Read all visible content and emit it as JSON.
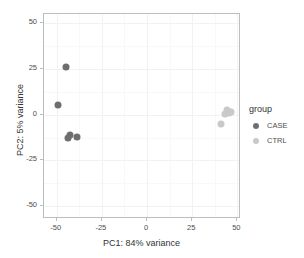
{
  "chart_data": {
    "type": "scatter",
    "title": "",
    "xlabel": "PC1: 84% variance",
    "ylabel": "PC2: 5% variance",
    "xlim": [
      -57,
      52
    ],
    "ylim": [
      -57,
      55
    ],
    "xticks": [
      -50,
      -25,
      0,
      25,
      50
    ],
    "yticks": [
      -50,
      -25,
      0,
      25,
      50
    ],
    "xtick_labels": [
      "-50",
      "-25",
      "0",
      "25",
      "50"
    ],
    "ytick_labels": [
      "-50",
      "-25",
      "0",
      "25",
      "50"
    ],
    "grid": true,
    "legend_position": "right",
    "legend_title": "group",
    "series": [
      {
        "name": "CASE",
        "color": "#6e6e6e",
        "points": [
          {
            "x": -45.0,
            "y": 26.0
          },
          {
            "x": -49.5,
            "y": 5.5
          },
          {
            "x": -42.5,
            "y": -11.0
          },
          {
            "x": -43.5,
            "y": -12.5
          },
          {
            "x": -39.0,
            "y": -12.0
          }
        ]
      },
      {
        "name": "CTRL",
        "color": "#c9c9c9",
        "points": [
          {
            "x": 44.0,
            "y": 2.5
          },
          {
            "x": 45.5,
            "y": 1.0
          },
          {
            "x": 43.0,
            "y": 0.5
          },
          {
            "x": 46.5,
            "y": 1.5
          },
          {
            "x": 41.0,
            "y": -5.0
          }
        ]
      }
    ]
  },
  "legend": {
    "title": "group",
    "items": [
      {
        "label": "CASE",
        "color": "#6e6e6e"
      },
      {
        "label": "CTRL",
        "color": "#c9c9c9"
      }
    ]
  },
  "axes": {
    "x_title": "PC1: 84% variance",
    "y_title": "PC2: 5% variance"
  }
}
